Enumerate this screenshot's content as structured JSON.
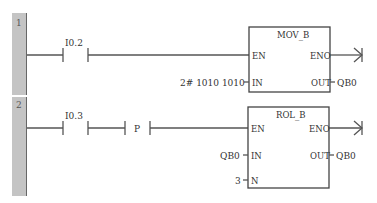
{
  "networks": [
    {
      "number": "1",
      "contacts": [
        {
          "address": "I0.2",
          "type": "normally-open"
        }
      ],
      "block": {
        "title": "MOV_B",
        "inputs": {
          "en": "EN",
          "in": "IN"
        },
        "outputs": {
          "eno": "ENO",
          "out": "OUT"
        },
        "in_value": "2# 1010 1010",
        "out_value": "QB0"
      }
    },
    {
      "number": "2",
      "contacts": [
        {
          "address": "I0.3",
          "type": "normally-open"
        },
        {
          "address": "P",
          "type": "positive-transition"
        }
      ],
      "block": {
        "title": "ROL_B",
        "inputs": {
          "en": "EN",
          "in": "IN",
          "n": "N"
        },
        "outputs": {
          "eno": "ENO",
          "out": "OUT"
        },
        "in_value": "QB0",
        "n_value": "3",
        "out_value": "QB0"
      }
    }
  ],
  "colors": {
    "rail": "#c4c4c4",
    "line": "#555555"
  }
}
